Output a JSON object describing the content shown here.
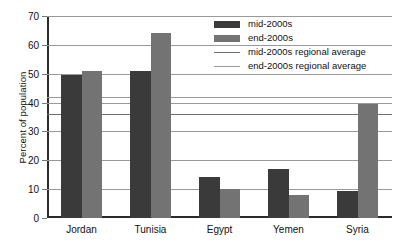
{
  "chart_data": {
    "type": "bar",
    "title": "",
    "xlabel": "",
    "ylabel": "Percent of population",
    "ylim": [
      0,
      70
    ],
    "ytick_step": 10,
    "yticks": [
      0,
      10,
      20,
      30,
      40,
      50,
      60,
      70
    ],
    "ytick_labels": [
      "0",
      "10",
      "20",
      "30",
      "40",
      "50",
      "60",
      "70"
    ],
    "grid": true,
    "legend_position": "upper-right-inside",
    "categories": [
      "Jordan",
      "Tunisia",
      "Egypt",
      "Yemen",
      "Syria"
    ],
    "series": [
      {
        "name": "mid-2000s",
        "kind": "bar",
        "color": "#3a3a3a",
        "values": [
          49.5,
          51.0,
          14.3,
          17.0,
          9.3
        ]
      },
      {
        "name": "end-2000s",
        "kind": "bar",
        "color": "#737373",
        "values": [
          50.8,
          64.0,
          10.0,
          8.0,
          39.5
        ]
      },
      {
        "name": "mid-2000s regional average",
        "kind": "hline",
        "color": "#6f6f6f",
        "value": 36.0
      },
      {
        "name": "end-2000s regional average",
        "kind": "hline",
        "color": "#9a9a9a",
        "value": 42.0
      }
    ]
  },
  "legend": {
    "items": [
      {
        "label": "mid-2000s",
        "marker": "filled-box",
        "color": "#3a3a3a"
      },
      {
        "label": "end-2000s",
        "marker": "filled-box",
        "color": "#737373"
      },
      {
        "label": "mid-2000s regional average",
        "marker": "line",
        "color": "#6f6f6f"
      },
      {
        "label": "end-2000s regional average",
        "marker": "line",
        "color": "#9a9a9a"
      }
    ]
  },
  "colors": {
    "bar_mid": "#3a3a3a",
    "bar_end": "#737373",
    "gridline": "#9a9a9a",
    "axis": "#2b2b2b",
    "background": "#ffffff",
    "avg_mid": "#6f6f6f",
    "avg_end": "#9a9a9a"
  }
}
